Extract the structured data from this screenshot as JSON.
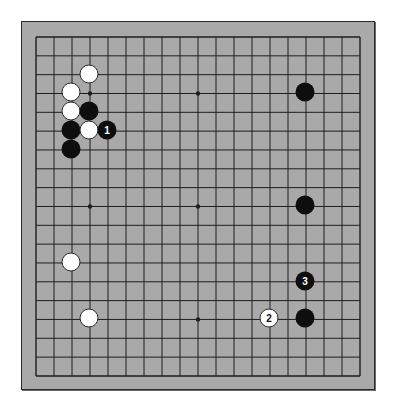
{
  "board": {
    "size": 19,
    "colors": {
      "board": "#a9a9a9",
      "line": "#1e1e1e",
      "black": "#0e0e0e",
      "white": "#ffffff"
    },
    "geometry": {
      "x0": 35,
      "y0": 36,
      "dx": 18.0,
      "dy": 18.83
    },
    "star_points": [
      [
        3,
        3
      ],
      [
        9,
        3
      ],
      [
        15,
        3
      ],
      [
        3,
        9
      ],
      [
        9,
        9
      ],
      [
        15,
        9
      ],
      [
        3,
        15
      ],
      [
        9,
        15
      ],
      [
        15,
        15
      ]
    ],
    "stones": [
      {
        "color": "white",
        "col": 3,
        "row": 2,
        "label": ""
      },
      {
        "color": "white",
        "col": 2,
        "row": 3,
        "label": ""
      },
      {
        "color": "white",
        "col": 2,
        "row": 4,
        "label": ""
      },
      {
        "color": "black",
        "col": 3,
        "row": 4,
        "label": ""
      },
      {
        "color": "black",
        "col": 2,
        "row": 5,
        "label": ""
      },
      {
        "color": "white",
        "col": 3,
        "row": 5,
        "label": ""
      },
      {
        "color": "black",
        "col": 4,
        "row": 5,
        "label": "1"
      },
      {
        "color": "black",
        "col": 2,
        "row": 6,
        "label": ""
      },
      {
        "color": "black",
        "col": 15,
        "row": 3,
        "label": ""
      },
      {
        "color": "black",
        "col": 15,
        "row": 9,
        "label": ""
      },
      {
        "color": "white",
        "col": 2,
        "row": 12,
        "label": ""
      },
      {
        "color": "black",
        "col": 15,
        "row": 13,
        "label": "3"
      },
      {
        "color": "white",
        "col": 3,
        "row": 15,
        "label": ""
      },
      {
        "color": "white",
        "col": 13,
        "row": 15,
        "label": "2"
      },
      {
        "color": "black",
        "col": 15,
        "row": 15,
        "label": ""
      }
    ]
  }
}
